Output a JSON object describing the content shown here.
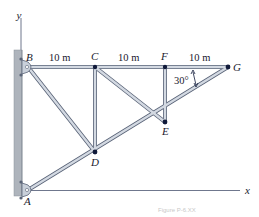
{
  "figure": {
    "caption": "Figure P-6.XX",
    "colors": {
      "member_fill": "#c9d0da",
      "member_edge": "#5a6478",
      "joint": "#101a3a",
      "wall": "#aeb4bc",
      "axis": "#4a5470",
      "text": "#1a1a2e"
    },
    "axes": {
      "x_label": "x",
      "y_label": "y"
    },
    "joints": [
      {
        "id": "A",
        "label": "A",
        "x": 28,
        "y": 190,
        "support": "pin"
      },
      {
        "id": "B",
        "label": "B",
        "x": 28,
        "y": 67,
        "support": "pin"
      },
      {
        "id": "C",
        "label": "C",
        "x": 95,
        "y": 67
      },
      {
        "id": "D",
        "label": "D",
        "x": 95,
        "y": 152
      },
      {
        "id": "E",
        "label": "E",
        "x": 165,
        "y": 122
      },
      {
        "id": "F",
        "label": "F",
        "x": 165,
        "y": 67
      },
      {
        "id": "G",
        "label": "G",
        "x": 228,
        "y": 67
      }
    ],
    "members": [
      [
        "B",
        "C"
      ],
      [
        "C",
        "F"
      ],
      [
        "F",
        "G"
      ],
      [
        "A",
        "D"
      ],
      [
        "D",
        "E"
      ],
      [
        "E",
        "G"
      ],
      [
        "B",
        "D"
      ],
      [
        "C",
        "D"
      ],
      [
        "C",
        "E"
      ],
      [
        "F",
        "E"
      ]
    ],
    "dimensions": [
      {
        "text": "10 m",
        "between": [
          "B",
          "C"
        ]
      },
      {
        "text": "10 m",
        "between": [
          "C",
          "F"
        ]
      },
      {
        "text": "10 m",
        "between": [
          "F",
          "G"
        ]
      }
    ],
    "angle": {
      "text": "30°",
      "at": "G"
    }
  }
}
